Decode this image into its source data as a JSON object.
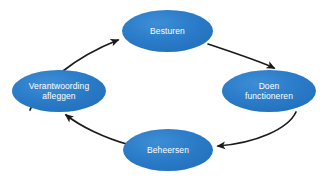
{
  "diagram": {
    "type": "cycle",
    "direction": "clockwise",
    "background_color": "#ffffff",
    "node_fill_color": "#2a7bc8",
    "node_text_color": "#ffffff",
    "arrow_color": "#1a1a1a",
    "nodes": [
      {
        "id": "besturen",
        "label": "Besturen",
        "position": "top",
        "cx": 167.5,
        "cy": 31,
        "rx": 45.5,
        "ry": 21
      },
      {
        "id": "doen-functioneren",
        "label": "Doen\nfunctioneren",
        "position": "right",
        "cx": 269,
        "cy": 91,
        "rx": 47,
        "ry": 21
      },
      {
        "id": "beheersen",
        "label": "Beheersen",
        "position": "bottom",
        "cx": 168,
        "cy": 150,
        "rx": 45,
        "ry": 21
      },
      {
        "id": "verantwoording-afleggen",
        "label": "Verantwoording\nafleggen",
        "position": "left",
        "cx": 59,
        "cy": 91,
        "rx": 47,
        "ry": 21
      }
    ],
    "arrows": [
      {
        "id": "arrow-verantwoording-to-besturen",
        "from": "verantwoording-afleggen",
        "to": "besturen"
      },
      {
        "id": "arrow-besturen-to-doen",
        "from": "besturen",
        "to": "doen-functioneren"
      },
      {
        "id": "arrow-doen-to-beheersen",
        "from": "doen-functioneren",
        "to": "beheersen"
      },
      {
        "id": "arrow-beheersen-to-verantwoording",
        "from": "beheersen",
        "to": "verantwoording-afleggen"
      }
    ]
  }
}
